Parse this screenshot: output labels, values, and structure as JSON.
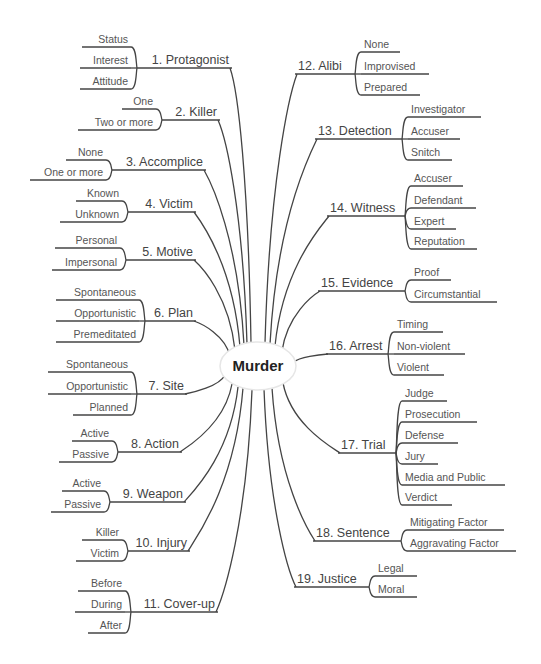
{
  "colors": {
    "line": "#444444",
    "branch_text": "#444444",
    "leaf_text": "#555555",
    "center_text": "#222222",
    "background": "#ffffff"
  },
  "center": {
    "label": "Murder"
  },
  "left_branches": [
    {
      "label": "1. Protagonist",
      "children": [
        "Status",
        "Interest",
        "Attitude"
      ]
    },
    {
      "label": "2. Killer",
      "children": [
        "One",
        "Two or more"
      ]
    },
    {
      "label": "3. Accomplice",
      "children": [
        "None",
        "One or more"
      ]
    },
    {
      "label": "4. Victim",
      "children": [
        "Known",
        "Unknown"
      ]
    },
    {
      "label": "5. Motive",
      "children": [
        "Personal",
        "Impersonal"
      ]
    },
    {
      "label": "6. Plan",
      "children": [
        "Spontaneous",
        "Opportunistic",
        "Premeditated"
      ]
    },
    {
      "label": "7. Site",
      "children": [
        "Spontaneous",
        "Opportunistic",
        "Planned"
      ]
    },
    {
      "label": "8. Action",
      "children": [
        "Active",
        "Passive"
      ]
    },
    {
      "label": "9. Weapon",
      "children": [
        "Active",
        "Passive"
      ]
    },
    {
      "label": "10. Injury",
      "children": [
        "Killer",
        "Victim"
      ]
    },
    {
      "label": "11. Cover-up",
      "children": [
        "Before",
        "During",
        "After"
      ]
    }
  ],
  "right_branches": [
    {
      "label": "12. Alibi",
      "children": [
        "None",
        "Improvised",
        "Prepared"
      ]
    },
    {
      "label": "13. Detection",
      "children": [
        "Investigator",
        "Accuser",
        "Snitch"
      ]
    },
    {
      "label": "14. Witness",
      "children": [
        "Accuser",
        "Defendant",
        "Expert",
        "Reputation"
      ]
    },
    {
      "label": "15. Evidence",
      "children": [
        "Proof",
        "Circumstantial"
      ]
    },
    {
      "label": "16. Arrest",
      "children": [
        "Timing",
        "Non-violent",
        "Violent"
      ]
    },
    {
      "label": "17. Trial",
      "children": [
        "Judge",
        "Prosecution",
        "Defense",
        "Jury",
        "Media and Public",
        "Verdict"
      ]
    },
    {
      "label": "18. Sentence",
      "children": [
        "Mitigating Factor",
        "Aggravating Factor"
      ]
    },
    {
      "label": "19. Justice",
      "children": [
        "Legal",
        "Moral"
      ]
    }
  ]
}
